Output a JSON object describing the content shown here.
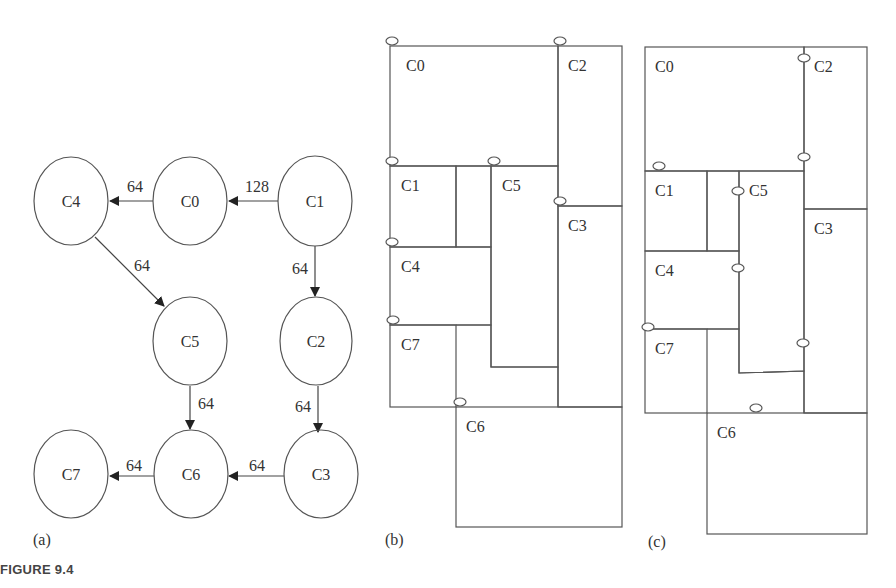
{
  "figure": {
    "caption": "FIGURE 9.4",
    "panels": [
      {
        "id": "a",
        "label": "(a)",
        "type": "task-graph"
      },
      {
        "id": "b",
        "label": "(b)",
        "type": "floorplan"
      },
      {
        "id": "c",
        "label": "(c)",
        "type": "floorplan"
      }
    ]
  },
  "graph": {
    "nodes": [
      {
        "id": "C4",
        "label": "C4",
        "cx": 71,
        "cy": 201
      },
      {
        "id": "C0",
        "label": "C0",
        "cx": 190,
        "cy": 201
      },
      {
        "id": "C1",
        "label": "C1",
        "cx": 315,
        "cy": 201
      },
      {
        "id": "C5",
        "label": "C5",
        "cx": 190,
        "cy": 341
      },
      {
        "id": "C2",
        "label": "C2",
        "cx": 316,
        "cy": 341
      },
      {
        "id": "C7",
        "label": "C7",
        "cx": 71,
        "cy": 474
      },
      {
        "id": "C6",
        "label": "C6",
        "cx": 191,
        "cy": 474
      },
      {
        "id": "C3",
        "label": "C3",
        "cx": 321,
        "cy": 474
      }
    ],
    "edges": [
      {
        "from": "C1",
        "to": "C0",
        "weight": "128"
      },
      {
        "from": "C0",
        "to": "C4",
        "weight": "64"
      },
      {
        "from": "C4",
        "to": "C5",
        "weight": "64"
      },
      {
        "from": "C1",
        "to": "C2",
        "weight": "64"
      },
      {
        "from": "C5",
        "to": "C6",
        "weight": "64"
      },
      {
        "from": "C2",
        "to": "C3",
        "weight": "64"
      },
      {
        "from": "C3",
        "to": "C6",
        "weight": "64"
      },
      {
        "from": "C6",
        "to": "C7",
        "weight": "64"
      }
    ]
  },
  "floorplan_b": {
    "blocks": [
      "C0",
      "C1",
      "C2",
      "C3",
      "C4",
      "C5",
      "C6",
      "C7"
    ],
    "labels": {
      "C0": "C0",
      "C1": "C1",
      "C2": "C2",
      "C3": "C3",
      "C4": "C4",
      "C5": "C5",
      "C6": "C6",
      "C7": "C7"
    }
  },
  "floorplan_c": {
    "blocks": [
      "C0",
      "C1",
      "C2",
      "C3",
      "C4",
      "C5",
      "C6",
      "C7"
    ],
    "labels": {
      "C0": "C0",
      "C1": "C1",
      "C2": "C2",
      "C3": "C3",
      "C4": "C4",
      "C5": "C5",
      "C6": "C6",
      "C7": "C7"
    }
  }
}
